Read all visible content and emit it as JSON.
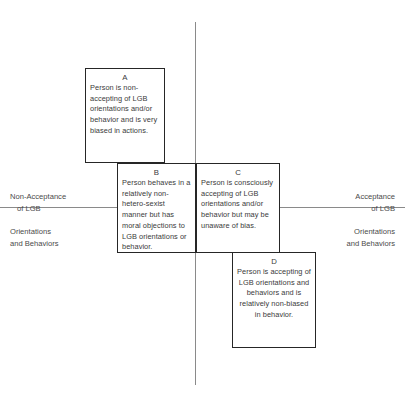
{
  "diagram": {
    "axes": {
      "vertical_color": "#8a8a8a",
      "horizontal_color": "#8a8a8a"
    },
    "labels": {
      "left_top_line1": "Non-Acceptance",
      "left_top_line2": "of LGB",
      "left_bottom_line1": "Orientations",
      "left_bottom_line2": "and Behaviors",
      "right_top_line1": "Acceptance",
      "right_top_line2": "of LGB",
      "right_bottom_line1": "Orientations",
      "right_bottom_line2": "and Behaviors"
    },
    "quadrants": [
      {
        "id": "A",
        "letter": "A",
        "text": "Person is non-accepting of LGB orientations and/or behavior and is very biased in actions."
      },
      {
        "id": "B",
        "letter": "B",
        "text": "Person behaves in a relatively non-hetero-sexist manner but has moral objections to LGB orientations or behavior."
      },
      {
        "id": "C",
        "letter": "C",
        "text": "Person is consciously accepting of LGB orientations and/or behavior but may be unaware of bias."
      },
      {
        "id": "D",
        "letter": "D",
        "text": "Person is accepting of LGB orientations and behaviors and is relatively non-biased in behavior."
      }
    ]
  }
}
